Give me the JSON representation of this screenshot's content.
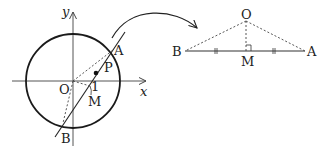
{
  "left_figure": {
    "axes": {
      "x_label": "x",
      "y_label": "y"
    },
    "points": {
      "origin": "O",
      "A": "A",
      "B": "B",
      "P": "P",
      "M": "M",
      "unit_mark": "1"
    }
  },
  "right_figure": {
    "points": {
      "O": "O",
      "B": "B",
      "A": "A",
      "M": "M"
    }
  },
  "colors": {
    "stroke": "#222222",
    "dashed": "#444444",
    "background": "#ffffff"
  }
}
